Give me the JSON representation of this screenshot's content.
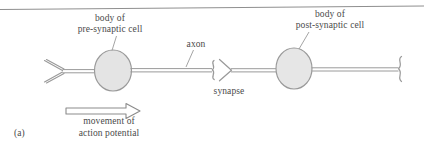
{
  "figure": {
    "panel_label": "(a)",
    "title_alt": "Signal transmission between two neurons across a synapse",
    "labels": {
      "pre_cell_line1": "body of",
      "pre_cell_line2": "pre-synaptic cell",
      "post_cell_line1": "body of",
      "post_cell_line2": "post-synaptic cell",
      "axon": "axon",
      "synapse": "synapse",
      "movement_line1": "movement of",
      "movement_line2": "action potential"
    },
    "colors": {
      "background": "#ffffff",
      "ink": "#4a4a4a",
      "stroke": "#8c8c8c",
      "soma_fill": "#e3e3e3",
      "soma_stroke": "#9a9a9a",
      "rule": "#8f8f8f"
    },
    "elements": {
      "top_rule": "page-rule",
      "pre_dendrite": "dendrite-fork",
      "pre_soma": "pre-synaptic-soma",
      "axon_shaft": "axon-shaft",
      "synapse_terminal": "synaptic-terminal",
      "post_soma": "post-synaptic-soma",
      "post_axon": "post-synaptic-axon",
      "post_terminal": "post-synaptic-terminal",
      "arrow": "action-potential-arrow",
      "leader_axon": "axon-leader-line",
      "leader_pre": "pre-cell-leader-line",
      "leader_post": "post-cell-leader-line"
    }
  }
}
